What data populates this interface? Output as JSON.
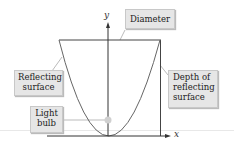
{
  "diagram": {
    "axes": {
      "x_label": "x",
      "y_label": "y"
    },
    "labels": {
      "diameter": "Diameter",
      "reflecting_surface": [
        "Reflecting",
        "surface"
      ],
      "depth": [
        "Depth of",
        "reflecting",
        "surface"
      ],
      "light_bulb": [
        "Light",
        "bulb"
      ]
    },
    "colors": {
      "curve": "#555555",
      "label_bg": "#e6e6e6",
      "leader": "#bbbbbb",
      "bulb": "#d0d0d0"
    }
  }
}
